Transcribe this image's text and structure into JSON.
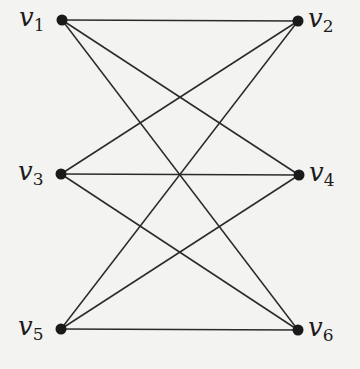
{
  "graph": {
    "type": "bipartite",
    "colors": {
      "edge": "#2a2a2a",
      "node": "#1a1a1a",
      "background": "#f3f3f1"
    },
    "nodes": [
      {
        "id": "v1",
        "base": "v",
        "sub": "1",
        "x": 62,
        "y": 20,
        "label_side": "left"
      },
      {
        "id": "v2",
        "base": "v",
        "sub": "2",
        "x": 298,
        "y": 21,
        "label_side": "right"
      },
      {
        "id": "v3",
        "base": "v",
        "sub": "3",
        "x": 61,
        "y": 174,
        "label_side": "left"
      },
      {
        "id": "v4",
        "base": "v",
        "sub": "4",
        "x": 299,
        "y": 175,
        "label_side": "right"
      },
      {
        "id": "v5",
        "base": "v",
        "sub": "5",
        "x": 61,
        "y": 329,
        "label_side": "left"
      },
      {
        "id": "v6",
        "base": "v",
        "sub": "6",
        "x": 298,
        "y": 330,
        "label_side": "right"
      }
    ],
    "edges": [
      [
        "v1",
        "v2"
      ],
      [
        "v1",
        "v4"
      ],
      [
        "v1",
        "v6"
      ],
      [
        "v3",
        "v2"
      ],
      [
        "v3",
        "v4"
      ],
      [
        "v3",
        "v6"
      ],
      [
        "v5",
        "v2"
      ],
      [
        "v5",
        "v4"
      ],
      [
        "v5",
        "v6"
      ]
    ]
  }
}
